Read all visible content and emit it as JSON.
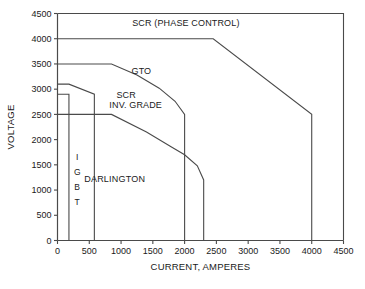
{
  "chart_data": {
    "type": "line",
    "title": "",
    "xlabel": "CURRENT, AMPERES",
    "ylabel": "VOLTAGE",
    "xlim": [
      0,
      4500
    ],
    "ylim": [
      0,
      4500
    ],
    "xticks": [
      "0",
      "500",
      "1000",
      "1500",
      "2000",
      "2500",
      "3000",
      "3500",
      "4000",
      "4500"
    ],
    "xtick_values": [
      0,
      500,
      1000,
      1500,
      2000,
      2500,
      3000,
      3500,
      4000,
      4500
    ],
    "yticks": [
      "0",
      "500",
      "1000",
      "1500",
      "2000",
      "2500",
      "3000",
      "3500",
      "4000",
      "4500"
    ],
    "ytick_values": [
      0,
      500,
      1000,
      1500,
      2000,
      2500,
      3000,
      3500,
      4000,
      4500
    ],
    "grid": false,
    "legend_position": "inline-annotations",
    "line_color": "#4a4a4a",
    "background_color": "#ffffff",
    "series": [
      {
        "name": "SCR (PHASE CONTROL)",
        "label": "SCR (PHASE CONTROL)",
        "x": [
          0,
          2450,
          4000,
          4000
        ],
        "y": [
          4000,
          4000,
          2500,
          0
        ],
        "label_x": 2020,
        "label_y": 4250
      },
      {
        "name": "GTO",
        "label": "GTO",
        "x": [
          0,
          850,
          1250,
          1600,
          1850,
          2000,
          2000
        ],
        "y": [
          3500,
          3500,
          3280,
          3020,
          2760,
          2500,
          0
        ],
        "label_x": 1320,
        "label_y": 3300
      },
      {
        "name": "SCR INV. GRADE",
        "label": "SCR\nINV. GRADE",
        "label_line1": "SCR",
        "label_line2": "INV. GRADE",
        "x": [
          0,
          850,
          1400,
          1800,
          2000,
          2200,
          2300,
          2300
        ],
        "y": [
          2500,
          2500,
          2150,
          1850,
          1700,
          1480,
          1200,
          0
        ],
        "label_x": 1080,
        "label_y": 2800
      },
      {
        "name": "DARLINGTON",
        "label": "DARLINGTON",
        "x": [
          0,
          180,
          580,
          580
        ],
        "y": [
          3100,
          3100,
          2900,
          0
        ],
        "label_x": 900,
        "label_y": 1150
      },
      {
        "name": "IGBT",
        "label": "IGBT",
        "letters": [
          "I",
          "G",
          "B",
          "T"
        ],
        "x": [
          0,
          180,
          180
        ],
        "y": [
          2900,
          2900,
          0
        ],
        "label_x": 310,
        "label_y": 1500
      }
    ],
    "annotations": [
      {
        "text": "SCR (PHASE CONTROL)",
        "x": 2020,
        "y": 4250
      },
      {
        "text": "GTO",
        "x": 1320,
        "y": 3300
      },
      {
        "text": "SCR",
        "x": 1080,
        "y": 2830
      },
      {
        "text": "INV. GRADE",
        "x": 1230,
        "y": 2620
      },
      {
        "text": "DARLINGTON",
        "x": 900,
        "y": 1150
      },
      {
        "text": "I",
        "x": 310,
        "y": 1600
      },
      {
        "text": "G",
        "x": 310,
        "y": 1300
      },
      {
        "text": "B",
        "x": 310,
        "y": 1000
      },
      {
        "text": "T",
        "x": 310,
        "y": 700
      }
    ]
  },
  "axes": {
    "y_title": "VOLTAGE",
    "x_title": "CURRENT, AMPERES"
  }
}
